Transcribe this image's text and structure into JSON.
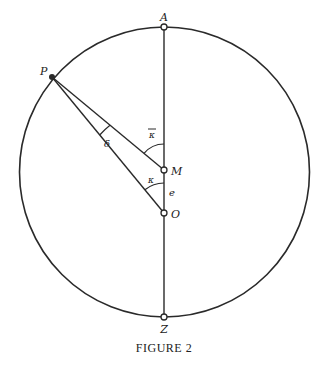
{
  "figure": {
    "caption": "FIGURE 2",
    "stroke_color": "#2a2a2a",
    "background": "#ffffff"
  },
  "points": {
    "A": {
      "label": "A",
      "x": 164,
      "y": 27
    },
    "Z": {
      "label": "Z",
      "x": 164,
      "y": 317
    },
    "M": {
      "label": "M",
      "x": 164,
      "y": 170
    },
    "O": {
      "label": "O",
      "x": 164,
      "y": 213
    },
    "P": {
      "label": "P",
      "x": 52,
      "y": 77
    }
  },
  "angles": {
    "kappa_bar": {
      "label": "κ",
      "overbar": true
    },
    "kappa": {
      "label": "κ"
    },
    "delta": {
      "label": "δ"
    }
  },
  "segments": {
    "e": {
      "label": "e"
    }
  }
}
